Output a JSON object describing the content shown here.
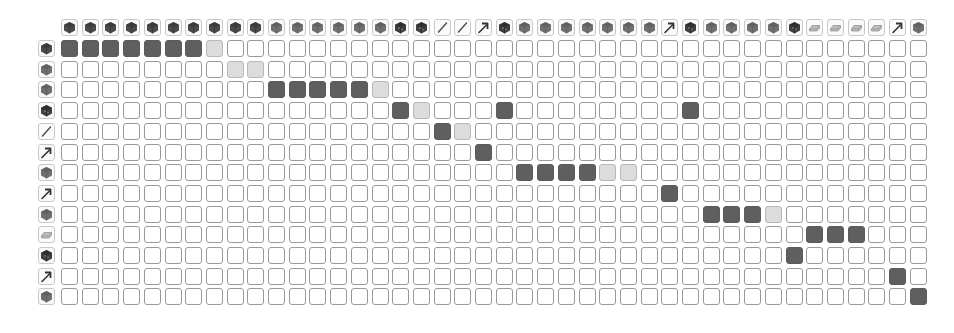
{
  "grid": {
    "rows": 13,
    "cols": 42,
    "origin_x": 61,
    "origin_y": 40,
    "pitch": 20.7,
    "header_y": 19,
    "rowicon_x": 38
  },
  "icon_types": {
    "cube-dark": {
      "fill": "#4a4a4a",
      "shade": "#2e2e2e"
    },
    "cube-medium": {
      "fill": "#707070",
      "shade": "#555555"
    },
    "cube-bumpy": {
      "fill": "#3e3e3e",
      "shade": "#222222"
    },
    "stick": {
      "stroke": "#555555"
    },
    "pickaxe": {
      "stroke": "#333333"
    },
    "ingot": {
      "fill": "#bdbdbd",
      "stroke": "#8a8a8a"
    }
  },
  "column_icons": [
    "cube-dark",
    "cube-dark",
    "cube-dark",
    "cube-dark",
    "cube-dark",
    "cube-dark",
    "cube-dark",
    "cube-dark",
    "cube-dark",
    "cube-dark",
    "cube-medium",
    "cube-medium",
    "cube-medium",
    "cube-medium",
    "cube-medium",
    "cube-medium",
    "cube-bumpy",
    "cube-bumpy",
    "stick",
    "stick",
    "pickaxe",
    "cube-bumpy",
    "cube-medium",
    "cube-medium",
    "cube-medium",
    "cube-medium",
    "cube-medium",
    "cube-medium",
    "cube-medium",
    "pickaxe",
    "cube-bumpy",
    "cube-medium",
    "cube-medium",
    "cube-medium",
    "cube-medium",
    "cube-bumpy",
    "ingot",
    "ingot",
    "ingot",
    "ingot",
    "pickaxe",
    "cube-medium"
  ],
  "row_icons": [
    "cube-dark",
    "cube-medium",
    "cube-medium",
    "cube-bumpy",
    "stick",
    "pickaxe",
    "cube-medium",
    "pickaxe",
    "cube-medium",
    "ingot",
    "cube-bumpy",
    "pickaxe",
    "cube-medium"
  ],
  "cells": {
    "dark": [
      [
        0,
        0
      ],
      [
        0,
        1
      ],
      [
        0,
        2
      ],
      [
        0,
        3
      ],
      [
        0,
        4
      ],
      [
        0,
        5
      ],
      [
        0,
        6
      ],
      [
        2,
        10
      ],
      [
        2,
        11
      ],
      [
        2,
        12
      ],
      [
        2,
        13
      ],
      [
        2,
        14
      ],
      [
        3,
        16
      ],
      [
        3,
        21
      ],
      [
        3,
        30
      ],
      [
        4,
        18
      ],
      [
        5,
        20
      ],
      [
        6,
        22
      ],
      [
        6,
        23
      ],
      [
        6,
        24
      ],
      [
        6,
        25
      ],
      [
        7,
        29
      ],
      [
        8,
        31
      ],
      [
        8,
        32
      ],
      [
        8,
        33
      ],
      [
        9,
        36
      ],
      [
        9,
        37
      ],
      [
        9,
        38
      ],
      [
        10,
        35
      ],
      [
        11,
        40
      ],
      [
        12,
        41
      ]
    ],
    "light": [
      [
        0,
        7
      ],
      [
        1,
        8
      ],
      [
        1,
        9
      ],
      [
        2,
        15
      ],
      [
        3,
        17
      ],
      [
        4,
        19
      ],
      [
        6,
        26
      ],
      [
        6,
        27
      ],
      [
        8,
        34
      ]
    ]
  },
  "colors": {
    "dark_cell": "#5f5f5f",
    "light_cell": "#dcdcdc",
    "empty_cell": "#ffffff",
    "cell_border": "#9a9a9a"
  }
}
